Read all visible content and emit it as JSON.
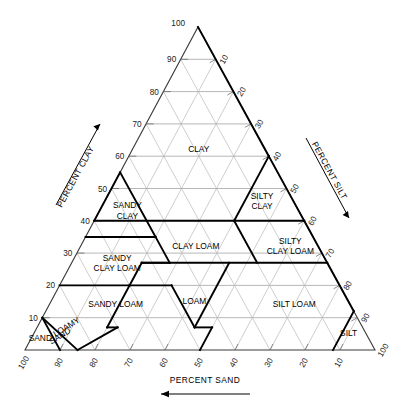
{
  "chart_data": {
    "type": "ternary",
    "axes": {
      "left": {
        "label": "PERCENT CLAY",
        "arrow": "up",
        "ticks": [
          10,
          20,
          30,
          40,
          50,
          60,
          70,
          80,
          90,
          100
        ]
      },
      "right": {
        "label": "PERCENT SILT",
        "arrow": "down",
        "ticks": [
          10,
          20,
          30,
          40,
          50,
          60,
          70,
          80,
          90,
          100
        ]
      },
      "bottom": {
        "label": "PERCENT SAND",
        "arrow": "left",
        "ticks": [
          10,
          20,
          30,
          40,
          50,
          60,
          70,
          80,
          90,
          100
        ]
      }
    },
    "apex_value": "100",
    "grid_step": 10,
    "grid": true,
    "colors": {
      "grid": "#b9b9b9",
      "outline": "#3b3b3b",
      "boundary": "#000000",
      "background": "#ffffff",
      "text": "#000000"
    },
    "regions": [
      {
        "name": "clay",
        "label": "CLAY",
        "label_pos": {
          "clay": 60,
          "sand": 22,
          "silt": 18
        },
        "vertices": [
          {
            "clay": 100,
            "silt": 0
          },
          {
            "clay": 55,
            "silt": 0
          },
          {
            "clay": 40,
            "silt": 0
          },
          {
            "clay": 40,
            "silt": 20
          },
          {
            "clay": 40,
            "silt": 40
          },
          {
            "clay": 60,
            "silt": 40
          }
        ]
      },
      {
        "name": "silty-clay",
        "label": "SILTY CLAY",
        "label_lines": [
          "SILTY",
          "CLAY"
        ],
        "label_pos": {
          "clay": 47,
          "sand": 6,
          "silt": 47
        },
        "vertices": [
          {
            "clay": 60,
            "silt": 40
          },
          {
            "clay": 40,
            "silt": 40
          },
          {
            "clay": 40,
            "silt": 60
          }
        ]
      },
      {
        "name": "sandy-clay",
        "label": "SANDY CLAY",
        "label_lines": [
          "SANDY",
          "CLAY"
        ],
        "label_pos": {
          "clay": 43,
          "sand": 50,
          "silt": 7
        },
        "vertices": [
          {
            "clay": 55,
            "silt": 0
          },
          {
            "clay": 35,
            "silt": 0
          },
          {
            "clay": 35,
            "silt": 20
          }
        ]
      },
      {
        "name": "clay-loam",
        "label": "CLAY LOAM",
        "label_pos": {
          "clay": 33,
          "sand": 34,
          "silt": 33
        },
        "vertices": [
          {
            "clay": 40,
            "silt": 20
          },
          {
            "clay": 40,
            "silt": 40
          },
          {
            "clay": 27,
            "silt": 53
          },
          {
            "clay": 27,
            "silt": 28
          }
        ]
      },
      {
        "name": "silty-clay-loam",
        "label": "SILTY CLAY LOAM",
        "label_lines": [
          "SILTY",
          "CLAY LOAM"
        ],
        "label_pos": {
          "clay": 33,
          "sand": 7,
          "silt": 60
        },
        "vertices": [
          {
            "clay": 40,
            "silt": 40
          },
          {
            "clay": 40,
            "silt": 60
          },
          {
            "clay": 27,
            "silt": 73
          },
          {
            "clay": 27,
            "silt": 53
          }
        ]
      },
      {
        "name": "sandy-clay-loam",
        "label": "SANDY CLAY LOAM",
        "label_lines": [
          "SANDY",
          "CLAY LOAM"
        ],
        "label_pos": {
          "clay": 27,
          "sand": 60,
          "silt": 13
        },
        "vertices": [
          {
            "clay": 35,
            "silt": 0
          },
          {
            "clay": 35,
            "silt": 20
          },
          {
            "clay": 27,
            "silt": 28
          },
          {
            "clay": 27,
            "silt": 20
          },
          {
            "clay": 20,
            "silt": 20
          },
          {
            "clay": 20,
            "silt": 0
          }
        ]
      },
      {
        "name": "loam",
        "label": "LOAM",
        "label_pos": {
          "clay": 17,
          "sand": 42,
          "silt": 41
        },
        "vertices": [
          {
            "clay": 27,
            "silt": 28
          },
          {
            "clay": 27,
            "silt": 45
          },
          {
            "clay": 7,
            "silt": 45
          },
          {
            "clay": 7,
            "silt": 52
          },
          {
            "clay": 20,
            "silt": 32
          },
          {
            "clay": 20,
            "silt": 20
          }
        ]
      },
      {
        "name": "silt-loam",
        "label": "SILT LOAM",
        "label_pos": {
          "clay": 15,
          "sand": 13,
          "silt": 72
        },
        "vertices": [
          {
            "clay": 27,
            "silt": 53
          },
          {
            "clay": 27,
            "silt": 73
          },
          {
            "clay": 12,
            "silt": 88
          },
          {
            "clay": 0,
            "silt": 88
          },
          {
            "clay": 0,
            "silt": 50
          },
          {
            "clay": 7,
            "silt": 50
          }
        ]
      },
      {
        "name": "silt",
        "label": "SILT",
        "label_pos": {
          "clay": 5,
          "sand": 6,
          "silt": 89
        },
        "vertices": [
          {
            "clay": 12,
            "silt": 88
          },
          {
            "clay": 0,
            "silt": 88
          },
          {
            "clay": 0,
            "silt": 100
          }
        ]
      },
      {
        "name": "sandy-loam",
        "label": "SANDY LOAM",
        "label_pos": {
          "clay": 14,
          "sand": 67,
          "silt": 19
        },
        "vertices": [
          {
            "clay": 20,
            "silt": 0
          },
          {
            "clay": 20,
            "silt": 32
          },
          {
            "clay": 7,
            "silt": 45
          },
          {
            "clay": 7,
            "silt": 23
          },
          {
            "clay": 0,
            "silt": 15
          },
          {
            "clay": 0,
            "silt": 0
          }
        ]
      },
      {
        "name": "loamy-sand",
        "label": "LOAMY SAND",
        "label_lines": [
          "LOAMY",
          "SAND"
        ],
        "label_pos": {
          "clay": 7,
          "sand": 84,
          "silt": 9
        },
        "rotated": true,
        "vertices": [
          {
            "clay": 10,
            "silt": 0
          },
          {
            "clay": 0,
            "silt": 15
          },
          {
            "clay": 0,
            "silt": 0
          }
        ]
      },
      {
        "name": "sand",
        "label": "SAND",
        "label_pos": {
          "clay": 4,
          "sand": 92,
          "silt": 4
        },
        "rotated": true,
        "vertices": [
          {
            "clay": 10,
            "silt": 0
          },
          {
            "clay": 0,
            "silt": 10
          },
          {
            "clay": 0,
            "silt": 0
          }
        ]
      }
    ]
  },
  "figure": {
    "apex_label": "100",
    "left_ticks": [
      "10",
      "20",
      "30",
      "40",
      "50",
      "60",
      "70",
      "80",
      "90"
    ],
    "right_ticks": [
      "10",
      "20",
      "30",
      "40",
      "50",
      "60",
      "70",
      "80",
      "90",
      "100"
    ],
    "bottom_ticks": [
      "100",
      "90",
      "80",
      "70",
      "60",
      "50",
      "40",
      "30",
      "20",
      "10"
    ],
    "left_axis_title": "PERCENT CLAY",
    "right_axis_title": "PERCENT SILT",
    "bottom_axis_title": "PERCENT SAND",
    "labels": {
      "clay": "CLAY",
      "silty_clay_1": "SILTY",
      "silty_clay_2": "CLAY",
      "sandy_clay_1": "SANDY",
      "sandy_clay_2": "CLAY",
      "clay_loam": "CLAY LOAM",
      "silty_clay_loam_1": "SILTY",
      "silty_clay_loam_2": "CLAY LOAM",
      "sandy_clay_loam_1": "SANDY",
      "sandy_clay_loam_2": "CLAY LOAM",
      "loam": "LOAM",
      "silt_loam": "SILT LOAM",
      "silt": "SILT",
      "sandy_loam": "SANDY LOAM",
      "loamy_1": "LOAMY",
      "loamy_2": "SAND",
      "sand": "SAND"
    }
  }
}
